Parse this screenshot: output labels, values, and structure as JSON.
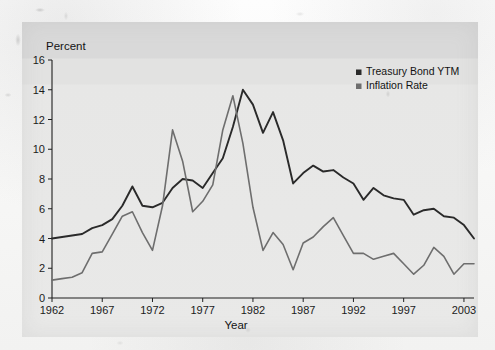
{
  "chart_data": {
    "type": "line",
    "title": "",
    "xlabel": "Year",
    "ylabel": "Percent",
    "ylim": [
      0,
      16
    ],
    "xlim": [
      1962,
      2004
    ],
    "grid": false,
    "legend_position": "top-right",
    "y_ticks": [
      0,
      2,
      4,
      6,
      8,
      10,
      12,
      14,
      16
    ],
    "x_ticks": [
      1962,
      1967,
      1972,
      1977,
      1982,
      1987,
      1992,
      1997,
      2003
    ],
    "x": [
      1962,
      1963,
      1964,
      1965,
      1966,
      1967,
      1968,
      1969,
      1970,
      1971,
      1972,
      1973,
      1974,
      1975,
      1976,
      1977,
      1978,
      1979,
      1980,
      1981,
      1982,
      1983,
      1984,
      1985,
      1986,
      1987,
      1988,
      1989,
      1990,
      1991,
      1992,
      1993,
      1994,
      1995,
      1996,
      1997,
      1998,
      1999,
      2000,
      2001,
      2002,
      2003,
      2004
    ],
    "series": [
      {
        "name": "Treasury Bond YTM",
        "color": "#2a2a2a",
        "values": [
          4.0,
          4.1,
          4.2,
          4.3,
          4.7,
          4.9,
          5.3,
          6.2,
          7.5,
          6.2,
          6.1,
          6.4,
          7.4,
          8.0,
          7.9,
          7.4,
          8.4,
          9.4,
          11.5,
          14.0,
          13.0,
          11.1,
          12.5,
          10.6,
          7.7,
          8.4,
          8.9,
          8.5,
          8.6,
          8.1,
          7.7,
          6.6,
          7.4,
          6.9,
          6.7,
          6.6,
          5.6,
          5.9,
          6.0,
          5.5,
          5.4,
          4.9,
          4.0
        ]
      },
      {
        "name": "Inflation Rate",
        "color": "#6e6e6e",
        "values": [
          1.2,
          1.3,
          1.4,
          1.7,
          3.0,
          3.1,
          4.3,
          5.5,
          5.8,
          4.4,
          3.2,
          6.2,
          11.3,
          9.2,
          5.8,
          6.5,
          7.6,
          11.3,
          13.6,
          10.4,
          6.1,
          3.2,
          4.4,
          3.6,
          1.9,
          3.7,
          4.1,
          4.8,
          5.4,
          4.2,
          3.0,
          3.0,
          2.6,
          2.8,
          3.0,
          2.3,
          1.6,
          2.2,
          3.4,
          2.8,
          1.6,
          2.3,
          2.3
        ]
      }
    ]
  },
  "legend": {
    "items": [
      {
        "label": "Treasury Bond YTM",
        "marker": "square-marker-dark"
      },
      {
        "label": "Inflation Rate",
        "marker": "square-marker-gray"
      }
    ]
  },
  "labels": {
    "y_axis_title": "Percent",
    "x_axis_title": "Year"
  }
}
